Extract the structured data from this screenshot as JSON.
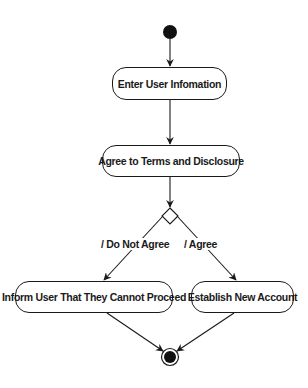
{
  "diagram": {
    "type": "uml-activity",
    "initial_node": {
      "name": "start"
    },
    "final_node": {
      "name": "end"
    },
    "activities": [
      {
        "id": "enter_info",
        "label": "Enter User Infomation"
      },
      {
        "id": "agree_terms",
        "label": "Agree to Terms and Disclosure"
      },
      {
        "id": "inform_user",
        "label": "Inform User That They Cannot Proceed"
      },
      {
        "id": "establish_account",
        "label": "Establish New Account"
      }
    ],
    "decision": {
      "id": "agree_decision"
    },
    "guards": [
      {
        "label": "/ Do Not Agree",
        "target": "inform_user"
      },
      {
        "label": "/ Agree",
        "target": "establish_account"
      }
    ],
    "edges": [
      {
        "from": "start",
        "to": "enter_info"
      },
      {
        "from": "enter_info",
        "to": "agree_terms"
      },
      {
        "from": "agree_terms",
        "to": "agree_decision"
      },
      {
        "from": "agree_decision",
        "to": "inform_user",
        "guard": "/ Do Not Agree"
      },
      {
        "from": "agree_decision",
        "to": "establish_account",
        "guard": "/ Agree"
      },
      {
        "from": "inform_user",
        "to": "end"
      },
      {
        "from": "establish_account",
        "to": "end"
      }
    ],
    "colors": {
      "stroke": "#1a1a1a",
      "fill": "#ffffff"
    }
  }
}
